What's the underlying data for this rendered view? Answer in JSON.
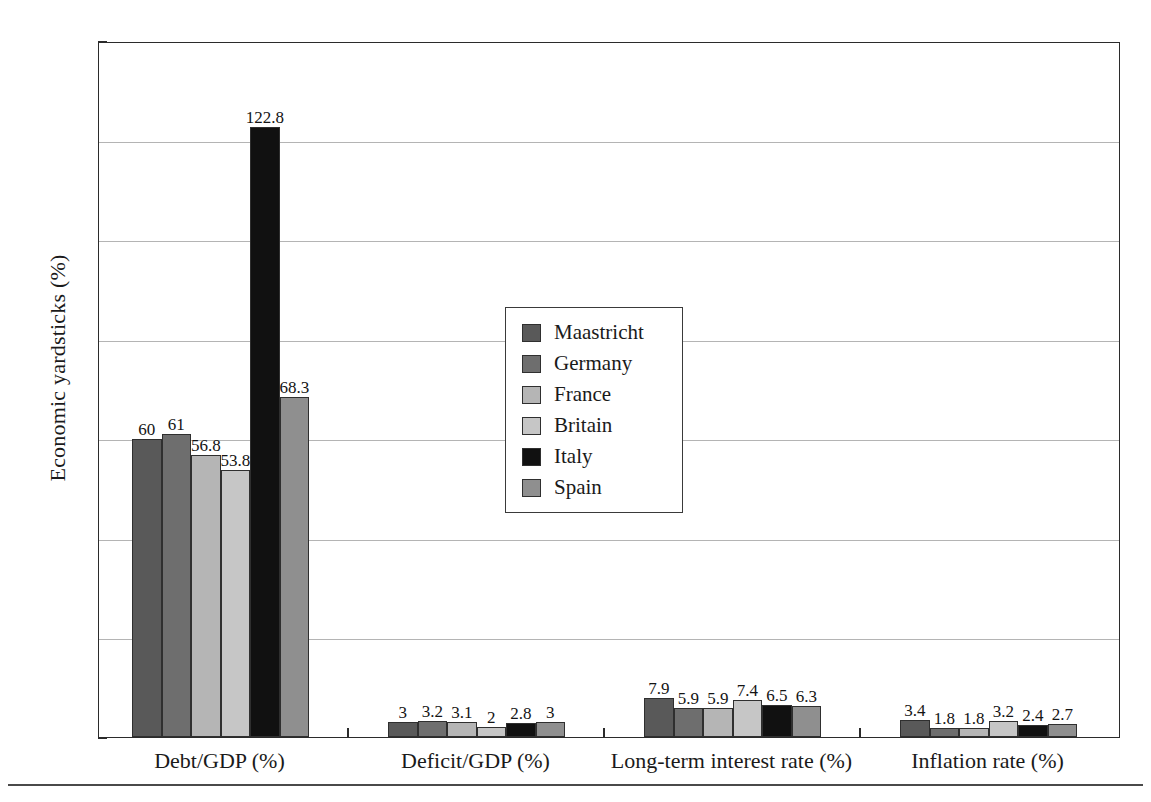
{
  "chart_data": {
    "type": "bar",
    "title": "",
    "subtitle": "",
    "xlabel": "",
    "ylabel": "Economic yardsticks (%)",
    "ylim": [
      0,
      140
    ],
    "yticks": [
      0,
      20,
      40,
      60,
      80,
      100,
      120,
      140
    ],
    "ytick_labels": [
      "0",
      "20",
      "40",
      "60",
      "80",
      "100",
      "120",
      "140"
    ],
    "grid": true,
    "grid_axis": "y",
    "legend_position": "center-left-inside",
    "categories": [
      "Debt/GDP (%)",
      "Deficit/GDP (%)",
      "Long-term interest rate (%)",
      "Inflation rate (%)"
    ],
    "series": [
      {
        "name": "Maastricht",
        "color": "#595959",
        "values": [
          60,
          3,
          7.9,
          3.4
        ],
        "labels": [
          "60",
          "3",
          "7.9",
          "3.4"
        ]
      },
      {
        "name": "Germany",
        "color": "#6e6e6e",
        "values": [
          61,
          3.2,
          5.9,
          1.8
        ],
        "labels": [
          "61",
          "3.2",
          "5.9",
          "1.8"
        ]
      },
      {
        "name": "France",
        "color": "#b5b5b5",
        "values": [
          56.8,
          3.1,
          5.9,
          1.8
        ],
        "labels": [
          "56.8",
          "3.1",
          "5.9",
          "1.8"
        ]
      },
      {
        "name": "Britain",
        "color": "#c6c6c6",
        "values": [
          53.8,
          2,
          7.4,
          3.2
        ],
        "labels": [
          "53.8",
          "2",
          "7.4",
          "3.2"
        ]
      },
      {
        "name": "Italy",
        "color": "#111111",
        "values": [
          122.8,
          2.8,
          6.5,
          2.4
        ],
        "labels": [
          "122.8",
          "2.8",
          "6.5",
          "2.4"
        ]
      },
      {
        "name": "Spain",
        "color": "#8f8f8f",
        "values": [
          68.3,
          3,
          6.3,
          2.7
        ],
        "labels": [
          "68.3",
          "3",
          "6.3",
          "2.7"
        ]
      }
    ]
  },
  "axis": {
    "y_title": "Economic yardsticks (%)"
  },
  "legend": {
    "entries": [
      {
        "label": "Maastricht"
      },
      {
        "label": "Germany"
      },
      {
        "label": "France"
      },
      {
        "label": "Britain"
      },
      {
        "label": "Italy"
      },
      {
        "label": "Spain"
      }
    ]
  }
}
